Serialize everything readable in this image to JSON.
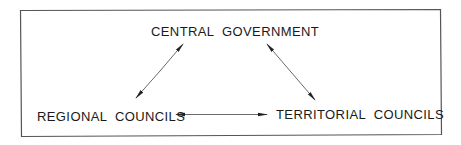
{
  "diagram": {
    "type": "relationship-triangle",
    "nodes": [
      {
        "id": "central",
        "label": "CENTRAL GOVERNMENT"
      },
      {
        "id": "regional",
        "label": "REGIONAL COUNCILS"
      },
      {
        "id": "territorial",
        "label": "TERRITORIAL COUNCILS"
      }
    ],
    "edges": [
      {
        "from": "central",
        "to": "regional",
        "direction": "bidirectional"
      },
      {
        "from": "central",
        "to": "territorial",
        "direction": "bidirectional"
      },
      {
        "from": "regional",
        "to": "territorial",
        "direction": "bidirectional"
      }
    ],
    "colors": {
      "border": "#555555",
      "text": "#1a1a1a",
      "arrow": "#333333"
    }
  }
}
